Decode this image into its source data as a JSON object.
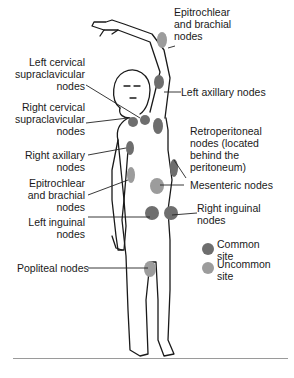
{
  "diagram": {
    "colors": {
      "common_site": "#6e6e6e",
      "uncommon_site": "#9c9c9c",
      "outline": "#1a1a1a",
      "leader_line": "#222222",
      "rule": "#9a9a9a"
    },
    "labels": {
      "epitrochlear_brachial_left": "Epitrochlear\nand brachial\nnodes",
      "left_cervical": "Left cervical\nsupraclavicular\nnodes",
      "left_axillary": "Left axillary nodes",
      "right_cervical": "Right cervical\nsupraclavicular\nnodes",
      "retroperitoneal": "Retroperitoneal\nnodes (located\nbehind the\nperitoneum)",
      "right_axillary": "Right axillary\nnodes",
      "mesenteric": "Mesenteric nodes",
      "epitrochlear_brachial_right": "Epitrochlear\nand brachial\nnodes",
      "right_inguinal": "Right inguinal\nnodes",
      "left_inguinal": "Left inguinal\nnodes",
      "popliteal": "Popliteal nodes"
    },
    "legend": {
      "common": "Common\nsite",
      "uncommon": "Uncommon\nsite"
    }
  }
}
